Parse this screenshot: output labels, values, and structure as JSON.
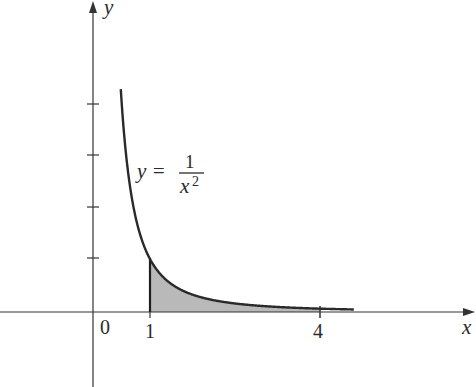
{
  "chart_data": {
    "type": "area",
    "title": "",
    "function": "y = 1/x^2",
    "xlabel": "x",
    "ylabel": "y",
    "x_ticks": [
      {
        "value": 0,
        "label": "0"
      },
      {
        "value": 1,
        "label": "1"
      },
      {
        "value": 4,
        "label": "4"
      }
    ],
    "y_ticks": [
      1,
      2,
      3,
      4
    ],
    "y_tick_labels_shown": false,
    "curve": {
      "x": [
        0.49,
        0.55,
        0.6,
        0.7,
        0.8,
        0.9,
        1.0,
        1.25,
        1.5,
        2.0,
        2.5,
        3.0,
        3.5,
        4.0,
        4.6
      ],
      "y": [
        4.16,
        3.31,
        2.78,
        2.04,
        1.56,
        1.23,
        1.0,
        0.64,
        0.44,
        0.25,
        0.16,
        0.11,
        0.08,
        0.0625,
        0.047
      ]
    },
    "shaded_region": {
      "from_x": 1,
      "to_x": 4,
      "description": "area under y=1/x^2 from x=1 to x=4"
    },
    "annotations": [
      {
        "text_lhs": "y =",
        "numerator": "1",
        "denominator": "x",
        "exponent": "2"
      }
    ],
    "xlim": [
      -1.6,
      6.7
    ],
    "ylim": [
      -1.45,
      6.0
    ],
    "grid": false,
    "colors": {
      "curve": "#2a2a2a",
      "axes": "#333333",
      "shade": "#b9b9b9"
    }
  },
  "labels": {
    "x_axis": "x",
    "y_axis": "y",
    "origin": "0",
    "tick_1": "1",
    "tick_4": "4",
    "eq_lhs": "y =",
    "eq_num": "1",
    "eq_den": "x",
    "eq_exp": "2"
  }
}
